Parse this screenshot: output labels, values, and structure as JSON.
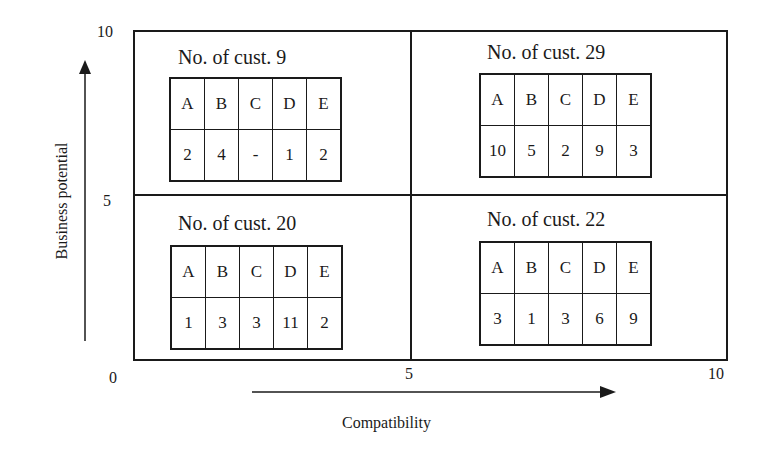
{
  "diagram": {
    "type": "2x2 portfolio matrix",
    "x_axis": {
      "label": "Compatibility",
      "ticks": [
        "0",
        "5",
        "10"
      ]
    },
    "y_axis": {
      "label": "Business potential",
      "ticks": [
        "0",
        "5",
        "10"
      ]
    },
    "quadrants": {
      "top_left": {
        "title": "No. of cust. 9",
        "headers": [
          "A",
          "B",
          "C",
          "D",
          "E"
        ],
        "values": [
          "2",
          "4",
          "-",
          "1",
          "2"
        ]
      },
      "top_right": {
        "title": "No. of cust. 29",
        "headers": [
          "A",
          "B",
          "C",
          "D",
          "E"
        ],
        "values": [
          "10",
          "5",
          "2",
          "9",
          "3"
        ]
      },
      "bottom_left": {
        "title": "No. of cust. 20",
        "headers": [
          "A",
          "B",
          "C",
          "D",
          "E"
        ],
        "values": [
          "1",
          "3",
          "3",
          "11",
          "2"
        ]
      },
      "bottom_right": {
        "title": "No. of cust. 22",
        "headers": [
          "A",
          "B",
          "C",
          "D",
          "E"
        ],
        "values": [
          "3",
          "1",
          "3",
          "6",
          "9"
        ]
      }
    },
    "colors": {
      "ink": "#1a1a1a",
      "background": "#ffffff"
    }
  }
}
